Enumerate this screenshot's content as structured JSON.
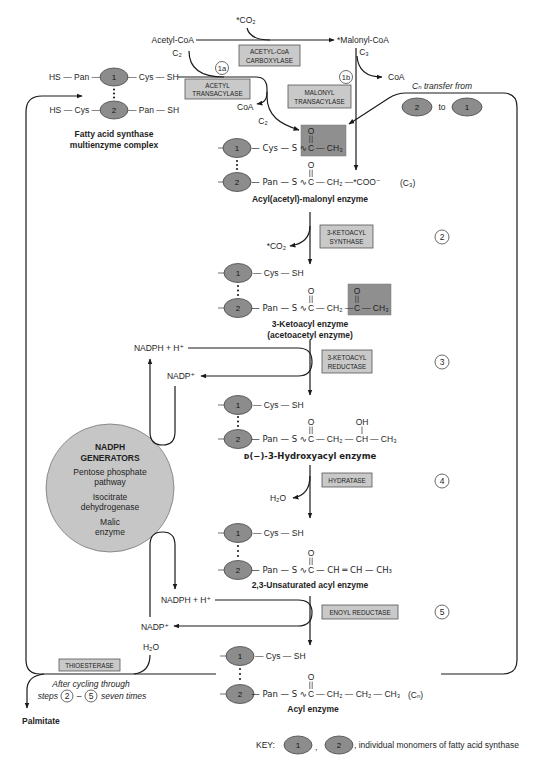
{
  "diagram": {
    "precursors": {
      "co2_in": "*CO₂",
      "acetyl_coa": "Acetyl-CoA",
      "acetyl_coa_carbons": "C₂",
      "malonyl_coa": "*Malonyl-CoA",
      "malonyl_coa_carbons": "C₃",
      "coa_from_acetyl": "CoA",
      "coa_from_malonyl": "CoA",
      "acetyl_transfer_carbons": "C₂"
    },
    "complex": {
      "row1_left": "HS — Pan —",
      "row1_right": "— Cys — SH",
      "row2_left": "HS — Cys —",
      "row2_right": "— Pan — SH",
      "label_line1": "Fatty acid synthase",
      "label_line2": "multienzyme complex"
    },
    "monomers": {
      "one": "1",
      "two": "2"
    },
    "transfer": {
      "label": "Cₙ  transfer from",
      "connector": "to"
    },
    "enzymes": {
      "acetyl_coa_carboxylase": [
        "ACETYL-CoA",
        "CARBOXYLASE"
      ],
      "acetyl_transacylase": [
        "ACETYL",
        "TRANSACYLASE"
      ],
      "malonyl_transacylase": [
        "MALONYL",
        "TRANSACYLASE"
      ],
      "ketoacyl_synthase": [
        "3-KETOACYL",
        "SYNTHASE"
      ],
      "ketoacyl_reductase": [
        "3-KETOACYL",
        "REDUCTASE"
      ],
      "hydratase": [
        "HYDRATASE"
      ],
      "enoyl_reductase": [
        "ENOYL REDUCTASE"
      ],
      "thioesterase": [
        "THIOESTERASE"
      ]
    },
    "steps": {
      "s1a": "1a",
      "s1b": "1b",
      "s2": "2",
      "s3": "3",
      "s4": "4",
      "s5": "5"
    },
    "atoms": {
      "oxygen": "O",
      "hydroxyl": "OH",
      "carbon": "C",
      "ch": "CH"
    },
    "intermediates": {
      "acyl_malonyl": {
        "row1_pre": "— Cys — S ∿",
        "row1_post": "— CH₃",
        "row2_pre": "— Pan — S ∿",
        "row2_post": "— CH₂ —*COO⁻",
        "carbon_count": "(C₃)",
        "name": "Acyl(acetyl)-malonyl enzyme"
      },
      "ketoacyl": {
        "row1": "— Cys — SH",
        "row2_pre": "— Pan — S ∿",
        "row2_mid": "— CH₂ —",
        "row2_post": "— CH₃",
        "name_line1": "3-Ketoacyl enzyme",
        "name_line2": "(acetoacetyl enzyme)"
      },
      "hydroxyacyl": {
        "row1": "— Cys — SH",
        "row2_pre": "— Pan — S ∿",
        "row2_mid": "— CH₂ —",
        "row2_post": "— CH₃",
        "name": "ᴅ(−)-3-Hydroxyacyl enzyme"
      },
      "unsaturated": {
        "row1": "— Cys — SH",
        "row2_pre": "— Pan — S ∿",
        "row2_post": "— CH ═ CH — CH₃",
        "name": "2,3-Unsaturated acyl enzyme"
      },
      "acyl": {
        "row1": "— Cys — SH",
        "row2_pre": "— Pan — S ∿",
        "row2_post": "— CH₂ — CH₂ — CH₃",
        "carbon_count": "(Cₙ)",
        "name": "Acyl enzyme"
      }
    },
    "cofactors": {
      "co2_out": "*CO₂",
      "nadph_1": "NADPH + H⁺",
      "nadp_1": "NADP⁺",
      "h2o_out": "H₂O",
      "nadph_2": "NADPH + H⁺",
      "nadp_2": "NADP⁺",
      "h2o_in": "H₂O"
    },
    "nadph_generators": {
      "title_line1": "NADPH",
      "title_line2": "GENERATORS",
      "items": [
        "Pentose phosphate",
        "pathway",
        "Isocitrate",
        "dehydrogenase",
        "Malic",
        "enzyme"
      ]
    },
    "release": {
      "note_line1": "After cycling through",
      "note_steps_word": "steps",
      "note_dash": "–",
      "note_times": "seven times",
      "product": "Palmitate"
    },
    "key": {
      "label": "KEY:",
      "separator": ",",
      "description": ", individual monomers of fatty acid synthase"
    },
    "colors": {
      "monomer_fill": "#8c8c8c",
      "enzyme_box_fill": "#c9c9c9",
      "highlight_fill": "#8f8f8f",
      "generator_fill": "#c6c6c6"
    }
  }
}
